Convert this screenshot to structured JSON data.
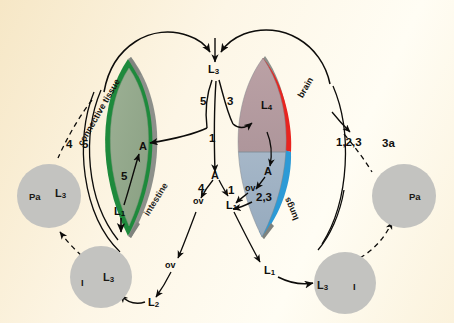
{
  "figure": {
    "type": "biological-life-cycle-diagram",
    "background_color": "#fdf6e6"
  },
  "organs": {
    "left_body": {
      "name": "left-host-outline",
      "rim_color": "#1e8a3c",
      "edge_color": "#8c8f8a",
      "fill_color": "#93a98c",
      "labels": [
        {
          "key": "connective_tissue",
          "text": "connective tissue"
        },
        {
          "key": "intestine",
          "text": "intestine"
        }
      ]
    },
    "right_body": {
      "name": "right-host-outline",
      "rim_top_color": "#e8241f",
      "rim_bottom_color": "#2c9ad6",
      "edge_color": "#8c8f8a",
      "fill_top_color": "#b59ca0",
      "fill_bottom_color": "#9fb2c4",
      "labels": [
        {
          "key": "brain",
          "text": "brain"
        },
        {
          "key": "lungs",
          "text": "lungs"
        }
      ]
    }
  },
  "circles": {
    "fill_color": "#c3c3c0",
    "items": [
      {
        "name": "circle-pa-left",
        "primary": "L",
        "sub": "3",
        "secondary": "Pa"
      },
      {
        "name": "circle-i-left",
        "primary": "L",
        "sub": "3",
        "secondary": "I"
      },
      {
        "name": "circle-i-right",
        "primary": "L",
        "sub": "3",
        "secondary": "I"
      },
      {
        "name": "circle-pa-right",
        "primary": "Pa",
        "sub": "",
        "secondary": ""
      }
    ]
  },
  "nodes": [
    {
      "name": "node-l3-top-center",
      "text": "L",
      "sub": "3"
    },
    {
      "name": "node-a-left-organ",
      "text": "A",
      "sub": ""
    },
    {
      "name": "node-l1-left-organ",
      "text": "L",
      "sub": "1"
    },
    {
      "name": "node-a-center",
      "text": "A",
      "sub": ""
    },
    {
      "name": "node-ov-center-upper",
      "text": "ov",
      "sub": ""
    },
    {
      "name": "node-ov-center-left",
      "text": "ov",
      "sub": ""
    },
    {
      "name": "node-ov-lower-left",
      "text": "ov",
      "sub": ""
    },
    {
      "name": "node-l2-bottom-left",
      "text": "L",
      "sub": "2"
    },
    {
      "name": "node-l1-center",
      "text": "L",
      "sub": "1"
    },
    {
      "name": "node-l1-bottom-right",
      "text": "L",
      "sub": "1"
    },
    {
      "name": "node-l4-right-organ",
      "text": "L",
      "sub": "4"
    },
    {
      "name": "node-a-right-organ",
      "text": "A",
      "sub": ""
    },
    {
      "name": "node-ov-right-organ",
      "text": "ov",
      "sub": ""
    },
    {
      "name": "node-l1-right-organ",
      "text": "L",
      "sub": "1"
    }
  ],
  "pathway_numbers": [
    {
      "name": "pathway-4-left",
      "text": "4"
    },
    {
      "name": "pathway-5-left-outer",
      "text": "5"
    },
    {
      "name": "pathway-5-left-inner",
      "text": "5"
    },
    {
      "name": "pathway-5-center",
      "text": "5"
    },
    {
      "name": "pathway-3-center",
      "text": "3"
    },
    {
      "name": "pathway-1-center",
      "text": "1"
    },
    {
      "name": "pathway-4-lower-left",
      "text": "4"
    },
    {
      "name": "pathway-1-lower-center",
      "text": "1"
    },
    {
      "name": "pathway-23-right",
      "text": "2,3"
    },
    {
      "name": "pathway-123-right",
      "text": "1,2,3"
    },
    {
      "name": "pathway-3a-right",
      "text": "3a"
    }
  ]
}
